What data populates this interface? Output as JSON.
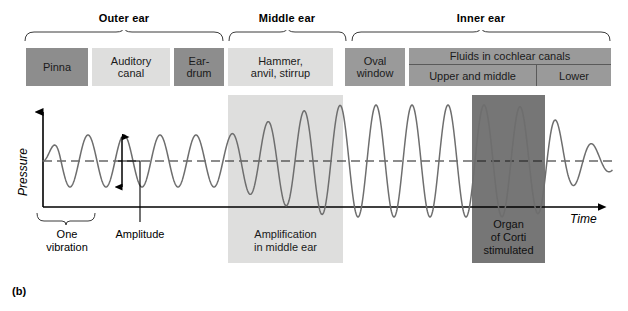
{
  "figure": {
    "panel_letter": "(b)",
    "sections": [
      {
        "name": "outer-ear",
        "label": "Outer ear",
        "title_center_x": 124,
        "brace_left": 24,
        "brace_right": 224
      },
      {
        "name": "middle-ear",
        "label": "Middle ear",
        "title_center_x": 287,
        "brace_left": 228,
        "brace_right": 347
      },
      {
        "name": "inner-ear",
        "label": "Inner ear",
        "title_center_x": 466,
        "brace_left": 351,
        "brace_right": 611
      }
    ],
    "anatomy_boxes": [
      {
        "name": "pinna",
        "label": "Pinna",
        "shade": "dark",
        "x": 26,
        "y": 48,
        "w": 62,
        "h": 38
      },
      {
        "name": "auditory-canal",
        "label": "Auditory\ncanal",
        "shade": "light",
        "x": 92,
        "y": 48,
        "w": 78,
        "h": 38
      },
      {
        "name": "eardrum",
        "label": "Ear-\ndrum",
        "shade": "dark",
        "x": 174,
        "y": 48,
        "w": 50,
        "h": 38
      },
      {
        "name": "ossicles",
        "label": "Hammer,\nanvil, stirrup",
        "shade": "light",
        "x": 228,
        "y": 48,
        "w": 105,
        "h": 38
      },
      {
        "name": "oval-window",
        "label": "Oval\nwindow",
        "shade": "mid",
        "x": 345,
        "y": 48,
        "w": 60,
        "h": 38
      }
    ],
    "cochlear_box": {
      "name": "fluids-in-cochlear-canals",
      "x": 409,
      "y": 48,
      "w": 202,
      "h": 38,
      "top_label": "Fluids in cochlear canals",
      "cells": [
        {
          "name": "upper-and-middle",
          "label": "Upper and middle",
          "flex": 1.72
        },
        {
          "name": "lower",
          "label": "Lower",
          "flex": 1.0
        }
      ]
    },
    "bands": [
      {
        "name": "amplification-band",
        "shade": "light",
        "x": 228,
        "y": 95,
        "w": 115,
        "h": 168,
        "label": "Amplification\nin middle ear",
        "label_x": 231,
        "label_y": 228,
        "label_w": 109
      },
      {
        "name": "organ-of-corti-band",
        "shade": "dark",
        "x": 472,
        "y": 95,
        "w": 73,
        "h": 168,
        "label": "Organ\nof Corti\nstimulated",
        "label_x": 470,
        "label_y": 218,
        "label_w": 77
      }
    ],
    "axes": {
      "y_label": "Pressure",
      "x_label": "Time",
      "y_label_x": 16,
      "y_label_y": 182,
      "x_label_x": 572,
      "x_label_y": 210,
      "origin_x": 43,
      "baseline_y": 207,
      "midline_y": 161,
      "top_y": 104,
      "right_x": 607
    },
    "annotations": [
      {
        "name": "one-vibration-annotation",
        "label": "One\nvibration",
        "label_x": 30,
        "label_y": 228,
        "label_w": 74,
        "brace_left": 36,
        "brace_right": 96,
        "brace_y": 212
      },
      {
        "name": "amplitude-annotation",
        "label": "Amplitude",
        "label_x": 98,
        "label_y": 228,
        "label_w": 84,
        "arrow_x": 122,
        "arrow_top": 134,
        "arrow_bottom": 190,
        "leader_corner_x": 140,
        "leader_y": 161,
        "leader_bottom_y": 222
      }
    ]
  },
  "chart_data": {
    "type": "line",
    "xlabel": "Time",
    "ylabel": "Pressure",
    "grid": false,
    "legend": null,
    "midline_value": 0,
    "series": [
      {
        "name": "pressure-wave",
        "color": "#6e6e6e",
        "amplitude_profile": [
          {
            "x": 43,
            "amplitude": 0
          },
          {
            "x": 60,
            "amplitude": 26
          },
          {
            "x": 150,
            "amplitude": 26
          },
          {
            "x": 228,
            "amplitude": 26
          },
          {
            "x": 270,
            "amplitude": 40
          },
          {
            "x": 310,
            "amplitude": 52
          },
          {
            "x": 343,
            "amplitude": 56
          },
          {
            "x": 430,
            "amplitude": 56
          },
          {
            "x": 500,
            "amplitude": 56
          },
          {
            "x": 545,
            "amplitude": 52
          },
          {
            "x": 570,
            "amplitude": 26
          },
          {
            "x": 600,
            "amplitude": 14
          },
          {
            "x": 612,
            "amplitude": 10
          }
        ],
        "period_px": 36,
        "phase_start": 0
      }
    ]
  }
}
